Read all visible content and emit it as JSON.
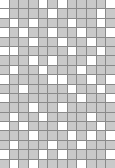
{
  "board": {
    "columns": 12,
    "rows": 18,
    "colors": {
      "filled": "#c9c9c9",
      "empty": "#ffffff",
      "gridline": "#8a8a8a"
    },
    "cells": [
      "100010100001",
      "100001000010",
      "010100010010",
      "101001001001",
      "000100100100",
      "110000010010",
      "000101000100",
      "010010001000",
      "100001100101",
      "001000010010",
      "100000001001",
      "000100100000",
      "010010000100",
      "101000100010",
      "000100010101",
      "010001001000",
      "100010100001",
      "010100001000"
    ]
  }
}
